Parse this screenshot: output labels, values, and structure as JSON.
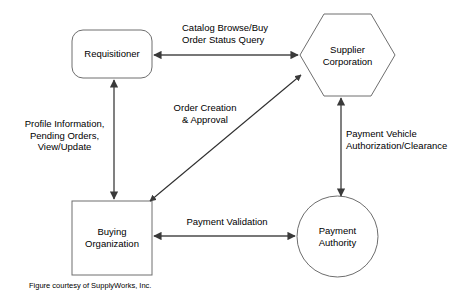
{
  "diagram": {
    "caption": "Figure courtesy of SupplyWorks, Inc.",
    "colors": {
      "background": "#ffffff",
      "shape_stroke": "#6e6e6e",
      "connector_stroke": "#4a4a4a",
      "text": "#000000"
    },
    "nodes": [
      {
        "id": "requisitioner",
        "label": "Requisitioner",
        "shape": "rounded-rectangle",
        "x": 72,
        "y": 30,
        "width": 80,
        "height": 48
      },
      {
        "id": "supplier-corporation",
        "label": "Supplier\nCorporation",
        "shape": "hexagon",
        "x": 300,
        "y": 14,
        "width": 95,
        "height": 82
      },
      {
        "id": "buying-organization",
        "label": "Buying\nOrganization",
        "shape": "rectangle",
        "x": 72,
        "y": 201,
        "width": 80,
        "height": 74
      },
      {
        "id": "payment-authority",
        "label": "Payment\nAuthority",
        "shape": "circle",
        "x": 297,
        "y": 196,
        "width": 81,
        "height": 81
      }
    ],
    "edges": [
      {
        "id": "requisitioner-supplier",
        "label": "Catalog Browse/Buy\nOrder Status Query",
        "from": "requisitioner",
        "to": "supplier-corporation",
        "direction": "bidirectional",
        "orientation": "horizontal"
      },
      {
        "id": "requisitioner-buying-organization",
        "label": "Profile Information,\nPending Orders,\nView/Update",
        "from": "requisitioner",
        "to": "buying-organization",
        "direction": "bidirectional",
        "orientation": "vertical"
      },
      {
        "id": "buying-organization-supplier",
        "label": "Order Creation\n& Approval",
        "from": "buying-organization",
        "to": "supplier-corporation",
        "direction": "bidirectional",
        "orientation": "diagonal"
      },
      {
        "id": "supplier-payment-authority",
        "label": "Payment Vehicle\nAuthorization/Clearance",
        "from": "supplier-corporation",
        "to": "payment-authority",
        "direction": "bidirectional",
        "orientation": "vertical"
      },
      {
        "id": "buying-organization-payment-authority",
        "label": "Payment Validation",
        "from": "buying-organization",
        "to": "payment-authority",
        "direction": "bidirectional",
        "orientation": "horizontal"
      }
    ]
  }
}
